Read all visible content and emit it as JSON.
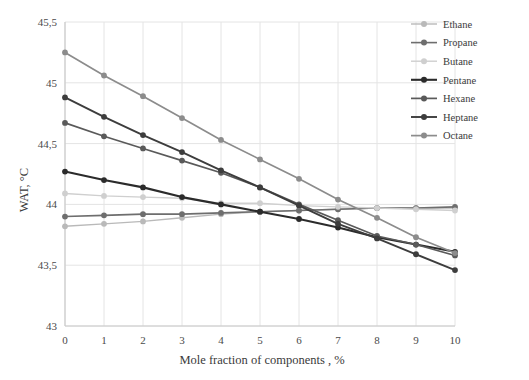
{
  "chart_data": {
    "type": "line",
    "title": "",
    "xlabel": "Mole fraction of components , %",
    "ylabel": "WAT, °C",
    "x": [
      0,
      1,
      2,
      3,
      4,
      5,
      6,
      7,
      8,
      9,
      10
    ],
    "xlim": [
      0,
      10
    ],
    "ylim": [
      43,
      45.5
    ],
    "xticks": [
      "0",
      "1",
      "2",
      "3",
      "4",
      "5",
      "6",
      "7",
      "8",
      "9",
      "10"
    ],
    "yticks": [
      "43",
      "43,5",
      "44",
      "44,5",
      "45",
      "45,5"
    ],
    "ytick_values": [
      43,
      43.5,
      44,
      44.5,
      45,
      45.5
    ],
    "grid": true,
    "legend_position": "top-right",
    "marker": "circle",
    "series": [
      {
        "name": "Ethane",
        "color": "#b9b9b9",
        "width": 1.4,
        "values": [
          43.82,
          43.84,
          43.86,
          43.89,
          43.92,
          43.94,
          43.95,
          43.96,
          43.97,
          43.97,
          43.97
        ]
      },
      {
        "name": "Propane",
        "color": "#6e6e6e",
        "width": 1.6,
        "values": [
          43.9,
          43.91,
          43.92,
          43.92,
          43.93,
          43.94,
          43.95,
          43.96,
          43.97,
          43.97,
          43.98
        ]
      },
      {
        "name": "Butane",
        "color": "#cfcfcf",
        "width": 1.4,
        "values": [
          44.09,
          44.07,
          44.06,
          44.05,
          44.01,
          44.01,
          43.99,
          43.98,
          43.97,
          43.96,
          43.95
        ]
      },
      {
        "name": "Pentane",
        "color": "#2b2b2b",
        "width": 2.1,
        "values": [
          44.27,
          44.2,
          44.14,
          44.06,
          44.0,
          43.94,
          43.88,
          43.81,
          43.73,
          43.67,
          43.61
        ]
      },
      {
        "name": "Hexane",
        "color": "#5a5a5a",
        "width": 1.7,
        "values": [
          44.67,
          44.56,
          44.46,
          44.36,
          44.26,
          44.14,
          44.0,
          43.87,
          43.74,
          43.67,
          43.58
        ]
      },
      {
        "name": "Heptane",
        "color": "#3d3d3d",
        "width": 1.9,
        "values": [
          44.88,
          44.72,
          44.57,
          44.43,
          44.28,
          44.14,
          43.99,
          43.84,
          43.72,
          43.59,
          43.46
        ]
      },
      {
        "name": "Octane",
        "color": "#8c8c8c",
        "width": 1.7,
        "values": [
          45.25,
          45.06,
          44.89,
          44.71,
          44.53,
          44.37,
          44.21,
          44.04,
          43.89,
          43.73,
          43.6
        ]
      }
    ]
  },
  "legend": {
    "items": [
      {
        "label": "Ethane"
      },
      {
        "label": "Propane"
      },
      {
        "label": "Butane"
      },
      {
        "label": "Pentane"
      },
      {
        "label": "Hexane"
      },
      {
        "label": "Heptane"
      },
      {
        "label": "Octane"
      }
    ]
  },
  "axes": {
    "y_title": "WAT, °C",
    "x_title": "Mole fraction of components , %"
  },
  "colors": {
    "grid": "#e4e4e4",
    "axis": "#c9c9c9",
    "text": "#3a3a3a",
    "background": "#ffffff"
  }
}
